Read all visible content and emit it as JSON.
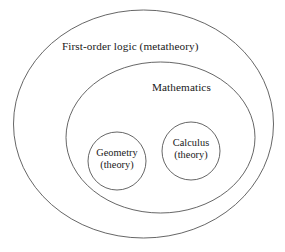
{
  "diagram": {
    "background_color": "#ffffff",
    "stroke_color": "#555555",
    "text_color": "#181818",
    "regions": {
      "outer": {
        "label": "First-order logic (metatheory)",
        "shape": "ellipse",
        "cx": 143.5,
        "cy": 124,
        "rx": 130,
        "ry": 114
      },
      "middle": {
        "label": "Mathematics",
        "shape": "ellipse",
        "cx": 160.5,
        "cy": 137.5,
        "rx": 94.5,
        "ry": 75.5
      },
      "geometry": {
        "label_line1": "Geometry",
        "label_line2": "(theory)",
        "shape": "circle",
        "cx": 117,
        "cy": 161,
        "r": 29
      },
      "calculus": {
        "label_line1": "Calculus",
        "label_line2": "(theory)",
        "shape": "circle",
        "cx": 191,
        "cy": 151,
        "r": 29
      }
    }
  }
}
